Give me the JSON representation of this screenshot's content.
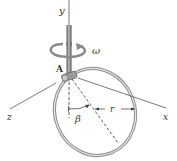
{
  "diagram": {
    "labels": {
      "y_axis": "y",
      "x_axis": "x",
      "z_axis": "z",
      "point_a": "A",
      "angular_velocity": "ω",
      "angle": "β",
      "radius": "r"
    },
    "colors": {
      "axis": "#444444",
      "rod": "#7a7a7a",
      "ring": "#888888",
      "arrow": "#8a8a8a",
      "text": "#333333"
    }
  }
}
